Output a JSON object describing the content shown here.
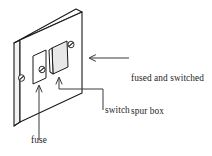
{
  "figure": {
    "name": "fused-and-switched-spur-box-diagram",
    "type": "line-drawing",
    "subject": "fused and switched spur box",
    "background_color": "#ffffff",
    "line_color": "#1a1a1a",
    "text_color": "#262626"
  },
  "labels": {
    "spur_box": {
      "line1": "fused and switched",
      "line2": "spur box",
      "pointer": "left-arrow"
    },
    "switch": {
      "text": "switch",
      "pointer": "up-arrow"
    },
    "fuse": {
      "text": "fuse",
      "pointer": "up-arrow"
    }
  },
  "parts": [
    {
      "name": "faceplate",
      "description": "rectangular wall plate drawn in isometric perspective"
    },
    {
      "name": "fuse-holder",
      "description": "small rectangular fuse carrier on left of faceplate"
    },
    {
      "name": "switch-rocker",
      "description": "raised rocker switch on right of faceplate"
    },
    {
      "name": "fixing-screw-left",
      "description": "screw at lower left of faceplate"
    },
    {
      "name": "fixing-screw-centre",
      "description": "screw between fuse holder and rocker"
    },
    {
      "name": "fixing-screw-right",
      "description": "screw at upper right of faceplate"
    }
  ]
}
